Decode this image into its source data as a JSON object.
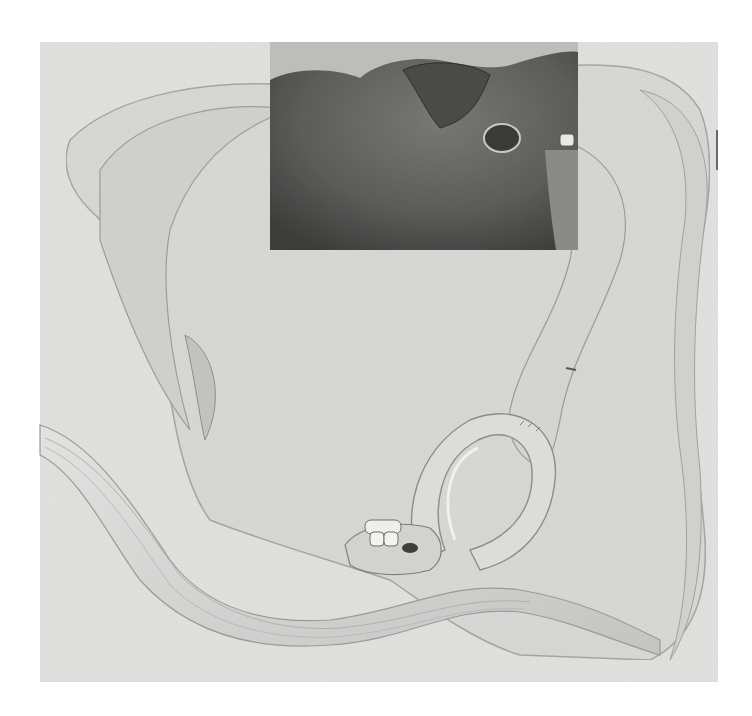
{
  "illustration": {
    "style": "grayscale pencil anatomical drawing",
    "colors": {
      "page_background": "#ffffff",
      "paper": "#e4e4e2",
      "paper_edge": "#d6d6d4",
      "organ_light": "#dcdcda",
      "organ_mid": "#c9c9c7",
      "inset_dark": "#6e6e6c",
      "inset_darker": "#4a4a48",
      "outline": "#8a8a88"
    },
    "regions": [
      {
        "name": "paper-panel",
        "x": 40,
        "y": 42,
        "width": 678,
        "height": 640
      },
      {
        "name": "dark-inset-panel",
        "x": 270,
        "y": 42,
        "width": 308,
        "height": 208
      },
      {
        "name": "coiled-bowel-loop",
        "x": 340,
        "y": 400,
        "width": 210,
        "height": 190
      },
      {
        "name": "anastomosis-stump",
        "x": 350,
        "y": 500,
        "width": 90,
        "height": 70
      }
    ]
  }
}
